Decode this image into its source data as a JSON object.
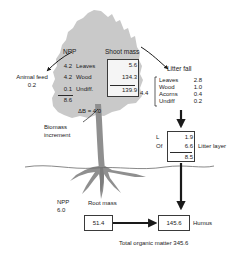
{
  "diagram": {
    "title_caption": "Total organic matter 345.6",
    "colors": {
      "canopy": "#c9c9c9",
      "trunk": "#8f8f8f",
      "ink": "#1a1a1a",
      "box_border": "#3a3a3a",
      "ground": "#6a6a6a"
    }
  },
  "animal_feed": {
    "label": "Animal feed",
    "value": "0.2"
  },
  "npp_shoot": {
    "header": "NPP",
    "rows": [
      {
        "value": "4.2",
        "label": "Leaves"
      },
      {
        "value": "4.2",
        "label": "Wood"
      },
      {
        "value": "0.1",
        "label": "Undiff."
      }
    ],
    "total": "8.6"
  },
  "biomass_increment": {
    "equation": "ΔB = 4.0",
    "label_line1": "Biomass",
    "label_line2": "increment"
  },
  "shoot_mass": {
    "header": "Shoot mass",
    "values": [
      "5.6",
      "134.3"
    ],
    "total": "139.9"
  },
  "litter_fall": {
    "header": "Litter fall",
    "flux": "4.4",
    "rows": [
      {
        "label": "Leaves",
        "value": "2.8"
      },
      {
        "label": "Wood",
        "value": "1.0"
      },
      {
        "label": "Acorns",
        "value": "0.4"
      },
      {
        "label": "Undiff",
        "value": "0.2"
      }
    ]
  },
  "litter_layer": {
    "header": "Litter layer",
    "rows": [
      {
        "label": "L",
        "value": "1.9"
      },
      {
        "label": "Of",
        "value": "6.6"
      }
    ],
    "total": "8.5"
  },
  "root": {
    "npp_label": "NPP",
    "npp_value": "6.0",
    "mass_label": "Root mass",
    "mass_value": "51.4"
  },
  "humus": {
    "value": "145.6",
    "label": "Humus"
  }
}
